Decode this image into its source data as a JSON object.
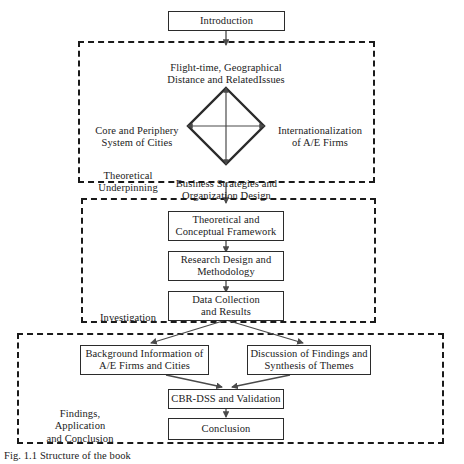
{
  "figure": {
    "caption": "Fig. 1.1 Structure of the book",
    "line_color": "#2b2b2b",
    "dash_color": "#1a1a1a",
    "background": "#ffffff"
  },
  "nodes": {
    "introduction": {
      "label": "Introduction"
    },
    "theoretical_framework": {
      "line1": "Theoretical and",
      "line2": "Conceptual Framework"
    },
    "research_design": {
      "line1": "Research Design and",
      "line2": "Methodology"
    },
    "data_collection": {
      "line1": "Data Collection",
      "line2": "and Results"
    },
    "background_info": {
      "line1": "Background Information of",
      "line2": "A/E Firms and Cities"
    },
    "discussion_findings": {
      "line1": "Discussion of Findings and",
      "line2": "Synthesis of Themes"
    },
    "cbr_dss": {
      "label": "CBR-DSS and Validation"
    },
    "conclusion": {
      "label": "Conclusion"
    }
  },
  "diamond_labels": {
    "top": {
      "line1": "Flight-time, Geographical",
      "line2": "Distance and RelatedIssues"
    },
    "left": {
      "line1": "Core and Periphery",
      "line2": "System of Cities"
    },
    "right": {
      "line1": "Internationalization",
      "line2": "of A/E Firms"
    },
    "bottom": {
      "line1": "Business Strategies and",
      "line2": "Organization Design"
    }
  },
  "groups": {
    "theoretical": {
      "line1": "Theoretical",
      "line2": "Underpinning"
    },
    "investigation": {
      "label": "Investigation"
    },
    "findings": {
      "line1": "Findings,",
      "line2": "Application",
      "line3": "and Conclusion"
    }
  }
}
